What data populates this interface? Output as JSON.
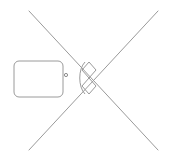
{
  "canvas": {
    "name": "drawing-canvas",
    "width": 173,
    "height": 161,
    "background_color": "#ffffff",
    "stroke_color": "#9a9a9a",
    "stroke_color_dark": "#8c8c8c",
    "stroke_width": 1,
    "title": ""
  },
  "shapes": {
    "diagonal_line_down": {
      "label": "",
      "type": "line",
      "x1": 29,
      "y1": 11,
      "x2": 158,
      "y2": 150,
      "color": "#9a9a9a"
    },
    "diagonal_line_up": {
      "label": "",
      "type": "line",
      "x1": 158,
      "y1": 11,
      "x2": 29,
      "y2": 150,
      "color": "#9a9a9a"
    },
    "rounded_rectangle": {
      "label": "",
      "type": "rounded-rect",
      "x": 14,
      "y": 61,
      "width": 49,
      "height": 36,
      "radius": 5,
      "color": "#9a9a9a",
      "fill": "none"
    },
    "dot_marker": {
      "label": "",
      "type": "circle",
      "cx": 66,
      "cy": 75,
      "r": 1.6,
      "color": "#8c8c8c",
      "fill": "none"
    },
    "center_diamond_upper": {
      "label": "",
      "type": "diamond",
      "cx": 89,
      "cy": 70,
      "half_width": 7,
      "half_height": 8,
      "color": "#9a9a9a"
    },
    "center_diamond_lower": {
      "label": "",
      "type": "diamond",
      "cx": 89,
      "cy": 86,
      "half_width": 7,
      "half_height": 8,
      "color": "#9a9a9a"
    },
    "center_arc": {
      "label": "",
      "type": "arc",
      "path": "M 85,62 C 78,69 78,87 85,94",
      "color": "#9a9a9a"
    },
    "intersection_point": {
      "label": "",
      "type": "point",
      "x": 89,
      "y": 78
    }
  },
  "labels": {
    "canvas_label": "",
    "shape_label": ""
  }
}
